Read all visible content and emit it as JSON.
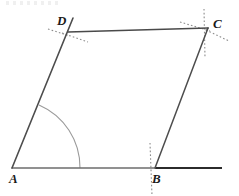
{
  "figure": {
    "type": "geometry-diagram",
    "canvas": {
      "width": 239,
      "height": 196,
      "background": "#ffffff"
    },
    "colors": {
      "solid_stroke": "#4d4d4d",
      "dark_stroke": "#3a3a3a",
      "ray_stroke": "#2b2b2b",
      "arc_stroke": "#9a9a9a",
      "construction_stroke": "#8c8c8c",
      "label_color": "#1a1a1a"
    },
    "vertices": [
      {
        "name": "A",
        "label": "A",
        "x": 12,
        "y": 168,
        "label_x": 9,
        "label_y": 172
      },
      {
        "name": "B",
        "label": "B",
        "x": 155,
        "y": 168,
        "label_x": 152,
        "label_y": 172
      },
      {
        "name": "C",
        "label": "C",
        "x": 208,
        "y": 28,
        "label_x": 213,
        "label_y": 17
      },
      {
        "name": "D",
        "label": "D",
        "x": 68,
        "y": 32,
        "label_x": 57,
        "label_y": 14
      }
    ],
    "sides": [
      {
        "name": "side-AB",
        "from": "A",
        "to": "B",
        "x1": 12,
        "y1": 168,
        "x2": 155,
        "y2": 168,
        "width": 1.4
      },
      {
        "name": "side-BC",
        "from": "B",
        "to": "C",
        "x1": 155,
        "y1": 168,
        "x2": 208,
        "y2": 28,
        "width": 1.5
      },
      {
        "name": "side-CD",
        "from": "C",
        "to": "D",
        "x1": 208,
        "y1": 28,
        "x2": 68,
        "y2": 32,
        "width": 1.6
      },
      {
        "name": "side-DA",
        "from": "D",
        "to": "A",
        "x1": 73,
        "y1": 18,
        "x2": 12,
        "y2": 168,
        "width": 1.6
      }
    ],
    "ray_beyond_B": {
      "name": "ray-AB-extended",
      "x1": 155,
      "y1": 168,
      "x2": 222,
      "y2": 168,
      "width": 2.0
    },
    "angle_arc_at_A": {
      "name": "angle-arc-A",
      "center_x": 12,
      "center_y": 168,
      "radius": 68,
      "start_x": 39,
      "start_y": 105,
      "end_x": 80,
      "end_y": 168
    },
    "construction_marks": [
      {
        "name": "arc-mark-D-upper-left",
        "x1": 48,
        "y1": 29,
        "x2": 70,
        "y2": 36
      },
      {
        "name": "arc-mark-D-lower-right",
        "x1": 62,
        "y1": 33,
        "x2": 88,
        "y2": 42
      },
      {
        "name": "arc-mark-D-vertical",
        "x1": 73,
        "y1": 18,
        "x2": 60,
        "y2": 50
      },
      {
        "name": "arc-mark-C-vertical",
        "x1": 204,
        "y1": 9,
        "x2": 205,
        "y2": 58
      },
      {
        "name": "arc-mark-C-upper-left",
        "x1": 180,
        "y1": 22,
        "x2": 210,
        "y2": 31
      },
      {
        "name": "arc-mark-C-lower-right",
        "x1": 206,
        "y1": 30,
        "x2": 229,
        "y2": 41
      },
      {
        "name": "arc-mark-B-vertical",
        "x1": 150,
        "y1": 143,
        "x2": 152,
        "y2": 196
      }
    ],
    "dash_pattern": "1.6 2.2"
  }
}
